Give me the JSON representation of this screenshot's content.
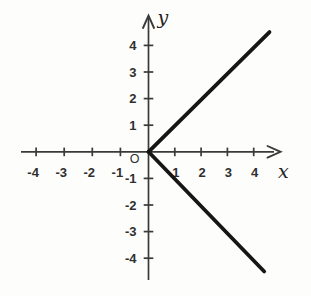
{
  "chart_data": {
    "type": "line",
    "title": "",
    "xlabel": "x",
    "ylabel": "y",
    "origin_label": "O",
    "xlim": [
      -4.8,
      5.0
    ],
    "ylim": [
      -5.1,
      5.1
    ],
    "grid": false,
    "legend_position": "none",
    "x_ticks": [
      {
        "v": -4,
        "label": "-4"
      },
      {
        "v": -3,
        "label": "-3"
      },
      {
        "v": -2,
        "label": "-2"
      },
      {
        "v": -1,
        "label": "-1"
      },
      {
        "v": 1,
        "label": "1"
      },
      {
        "v": 2,
        "label": "2"
      },
      {
        "v": 3,
        "label": "3"
      },
      {
        "v": 4,
        "label": "4"
      }
    ],
    "y_ticks": [
      {
        "v": -4,
        "label": "-4"
      },
      {
        "v": -3,
        "label": "-3"
      },
      {
        "v": -2,
        "label": "-2"
      },
      {
        "v": -1,
        "label": "-1"
      },
      {
        "v": 1,
        "label": "1"
      },
      {
        "v": 2,
        "label": "2"
      },
      {
        "v": 3,
        "label": "3"
      },
      {
        "v": 4,
        "label": "4"
      }
    ],
    "series": [
      {
        "name": "ray y = x for x >= 0",
        "x": [
          0,
          4.6
        ],
        "y": [
          0,
          4.5
        ]
      },
      {
        "name": "ray y = -x for x >= 0",
        "x": [
          0,
          4.4
        ],
        "y": [
          0,
          -4.5
        ]
      }
    ],
    "colors": {
      "curve": "#161616",
      "axis": "#3a3a3a",
      "tick_label": "#2f2f2f",
      "background": "#fdfdfc"
    }
  }
}
